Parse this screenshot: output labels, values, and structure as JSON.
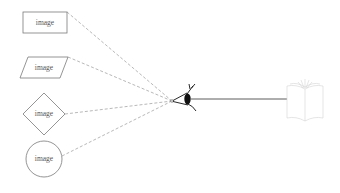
{
  "diagram": {
    "type": "perception-sketch",
    "source_shapes": [
      {
        "id": "rectangle",
        "label": "image",
        "shape": "rectangle"
      },
      {
        "id": "parallelogram",
        "label": "image",
        "shape": "parallelogram"
      },
      {
        "id": "diamond",
        "label": "image",
        "shape": "diamond"
      },
      {
        "id": "circle",
        "label": "image",
        "shape": "circle"
      }
    ],
    "viewer": {
      "icon": "eye-icon"
    },
    "target": {
      "icon": "open-book-icon"
    },
    "connections": [
      {
        "from": "rectangle",
        "to": "viewer",
        "style": "dashed"
      },
      {
        "from": "parallelogram",
        "to": "viewer",
        "style": "dashed"
      },
      {
        "from": "diamond",
        "to": "viewer",
        "style": "dashed"
      },
      {
        "from": "circle",
        "to": "viewer",
        "style": "dashed"
      },
      {
        "from": "viewer",
        "to": "target",
        "style": "solid"
      }
    ],
    "colors": {
      "shape_stroke": "#7a7a7a",
      "dash_stroke": "#9a9a9a",
      "eye": "#111111",
      "book_stroke": "#d4d4d4"
    }
  }
}
